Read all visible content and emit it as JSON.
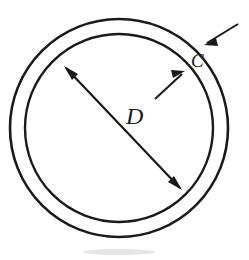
{
  "figure": {
    "title": "Annulus cross-section dimension diagram",
    "background_color": "#ffffff",
    "line_color": "#1a1a1a",
    "width": 249,
    "height": 260
  },
  "labels": {
    "diameter": "D",
    "thickness": "C"
  },
  "geometry": {
    "center_x": 119,
    "center_y": 128,
    "outer_radius": 109,
    "inner_radius": 94,
    "stroke_width": 2.4,
    "diameter_start_x": 66,
    "diameter_start_y": 68,
    "diameter_end_x": 180,
    "diameter_end_y": 188,
    "outer_callout_tail_x": 238,
    "outer_callout_tail_y": 24,
    "outer_callout_tip_x": 205,
    "outer_callout_tip_y": 44,
    "inner_callout_tail_x": 155,
    "inner_callout_tail_y": 99,
    "inner_callout_tip_x": 184,
    "inner_callout_tip_y": 72
  },
  "label_positions": {
    "diameter_x": 126,
    "diameter_y": 124,
    "diameter_font_size": 24,
    "thickness_x": 191,
    "thickness_y": 67,
    "thickness_font_size": 19
  }
}
